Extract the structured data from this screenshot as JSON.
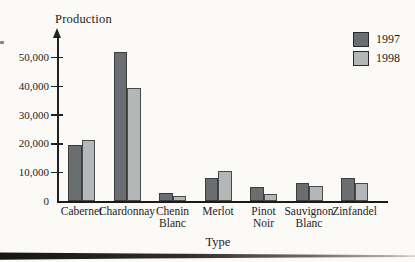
{
  "figure": {
    "background": "#fbfaf7",
    "y_axis_title": "Production",
    "x_axis_title": "Type"
  },
  "chart_data": {
    "type": "bar",
    "title": "",
    "ylabel": "Production",
    "xlabel": "Type",
    "categories": [
      "Cabernet",
      "Chardonnay",
      "Chenin Blanc",
      "Merlot",
      "Pinot Noir",
      "Sauvignon Blanc",
      "Zinfandel"
    ],
    "category_label_lines": [
      [
        "Cabernet"
      ],
      [
        "Chardonnay"
      ],
      [
        "Chenin",
        "Blanc"
      ],
      [
        "Merlot"
      ],
      [
        "Pinot",
        "Noir"
      ],
      [
        "Sauvignon",
        "Blanc"
      ],
      [
        "Zinfandel"
      ]
    ],
    "series": [
      {
        "name": "1997",
        "color": "#6a6e71",
        "values": [
          19500,
          52000,
          3000,
          8000,
          5000,
          6500,
          8000
        ]
      },
      {
        "name": "1998",
        "color": "#b4b7b7",
        "values": [
          21500,
          39500,
          2000,
          10500,
          2500,
          5500,
          6500
        ]
      }
    ],
    "y_ticks": [
      {
        "label": "0",
        "value": 0
      },
      {
        "label": "10,000",
        "value": 10000
      },
      {
        "label": "20,000",
        "value": 20000
      },
      {
        "label": "30,000",
        "value": 30000
      },
      {
        "label": "40,000",
        "value": 40000
      },
      {
        "label": "50,000",
        "value": 50000
      }
    ],
    "ylim": [
      0,
      55000
    ],
    "grid": false,
    "legend_position": "top-right"
  },
  "legend": {
    "items": [
      {
        "label": "1997",
        "color": "#6a6e71"
      },
      {
        "label": "1998",
        "color": "#b4b7b7"
      }
    ]
  }
}
